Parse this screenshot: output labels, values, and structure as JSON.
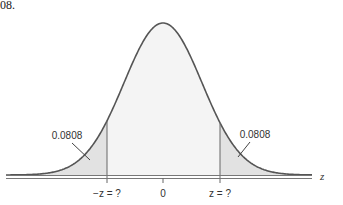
{
  "caption_fragment": "08.",
  "diagram": {
    "type": "normal-distribution",
    "axis_label": "z",
    "tick_labels": [
      "−z = ?",
      "0",
      "z = ?"
    ],
    "left_tail_area": "0.0808",
    "right_tail_area": "0.0808",
    "colors": {
      "curve": "#555555",
      "tail_fill": "#e2e2e2",
      "center_fill": "#f4f4f4",
      "axis": "#666666"
    }
  }
}
